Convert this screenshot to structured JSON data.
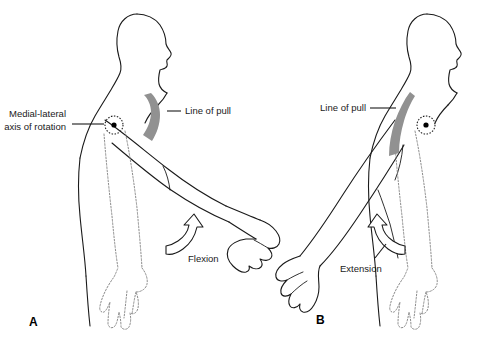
{
  "figure": {
    "background_color": "#ffffff",
    "ink_color": "#1a1a1a",
    "muscle_color": "#919191",
    "ghost_color": "#7d7d7d"
  },
  "panels": [
    {
      "id": "A",
      "label": "A",
      "motion": "Flexion",
      "labels": {
        "axis": "Medial-lateral\naxis of rotation",
        "axis_line1": "Medial-lateral",
        "axis_line2": "axis of rotation",
        "line_of_pull": "Line of pull",
        "motion": "Flexion"
      }
    },
    {
      "id": "B",
      "label": "B",
      "motion": "Extension",
      "labels": {
        "line_of_pull": "Line of pull",
        "motion": "Extension"
      }
    }
  ],
  "annotations": {
    "axis_marker_name": "medial-lateral axis of rotation",
    "muscle_name": "line of pull (biceps brachii)",
    "ghost_limb_name": "starting position of limb (dashed)"
  }
}
